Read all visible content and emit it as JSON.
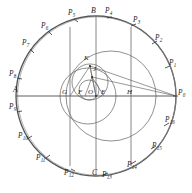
{
  "figure": {
    "name": "heptadecagon-circle-construction",
    "background": "#ffffff",
    "stroke_main": "#555555",
    "stroke_thin": "#6b6b6b",
    "stroke_label": "#1d1d1d",
    "width": 192,
    "height": 193
  },
  "circles": {
    "main": {
      "cx": 96,
      "cy": 96,
      "r": 80,
      "label": "main-circle"
    },
    "inner_large": {
      "cx": 111,
      "cy": 96,
      "r": 45,
      "label": "inner-large-circle"
    },
    "inner_medium": {
      "cx": 88,
      "cy": 96,
      "r": 28,
      "label": "inner-medium-circle"
    },
    "inner_small": {
      "cx": 90,
      "cy": 82,
      "r": 18,
      "label": "inner-small-circle"
    },
    "inner_tiny": {
      "cx": 89,
      "cy": 90,
      "r": 10,
      "label": "inner-tiny-circle"
    }
  },
  "axes": {
    "horizontal_diameter": {
      "x1": 16,
      "y1": 96,
      "x2": 176,
      "y2": 96,
      "label": "diameter-A-P0"
    },
    "vertical_diameter": {
      "x1": 96,
      "y1": 16,
      "x2": 96,
      "y2": 176,
      "label": "diameter-B-C"
    },
    "chord_through_G": {
      "x": 70,
      "y1": 27,
      "y2": 166,
      "label": "vertical-chord-G"
    },
    "chord_through_H": {
      "x": 131,
      "y1": 27,
      "y2": 166,
      "label": "vertical-chord-H"
    }
  },
  "rays": [
    {
      "name": "ray-J-to-P0",
      "x1": 92,
      "y1": 77,
      "x2": 176,
      "y2": 96
    },
    {
      "name": "ray-K-to-P0",
      "x1": 90,
      "y1": 66,
      "x2": 176,
      "y2": 96
    },
    {
      "name": "ray-K-to-O",
      "x1": 90,
      "y1": 66,
      "x2": 96,
      "y2": 96
    },
    {
      "name": "ray-J-to-F",
      "x1": 92,
      "y1": 77,
      "x2": 85,
      "y2": 96
    },
    {
      "name": "ray-J-to-O",
      "x1": 92,
      "y1": 77,
      "x2": 96,
      "y2": 96
    },
    {
      "name": "ray-J-to-E",
      "x1": 92,
      "y1": 77,
      "x2": 104,
      "y2": 96
    },
    {
      "name": "ray-K-to-G",
      "x1": 90,
      "y1": 66,
      "x2": 70,
      "y2": 96
    }
  ],
  "labels": {
    "perimeter_points": [
      {
        "id": "P0",
        "text": "P",
        "sub": "0",
        "x": 178,
        "y": 93,
        "tick": {
          "x1": 174,
          "y1": 96,
          "x2": 178,
          "y2": 96
        }
      },
      {
        "id": "P1",
        "text": "P",
        "sub": "1",
        "x": 169,
        "y": 63,
        "tick": {
          "x1": 166,
          "y1": 68,
          "x2": 170,
          "y2": 66
        }
      },
      {
        "id": "P2",
        "text": "P",
        "sub": "2",
        "x": 155,
        "y": 38,
        "tick": {
          "x1": 153,
          "y1": 44,
          "x2": 157,
          "y2": 41
        }
      },
      {
        "id": "P3",
        "text": "P",
        "sub": "3",
        "x": 133,
        "y": 20,
        "tick": {
          "x1": 132,
          "y1": 26,
          "x2": 136,
          "y2": 24
        }
      },
      {
        "id": "P4",
        "text": "P",
        "sub": "4",
        "x": 105,
        "y": 11,
        "tick": {
          "x1": 107,
          "y1": 18,
          "x2": 111,
          "y2": 17
        }
      },
      {
        "id": "P5",
        "text": "P",
        "sub": "5",
        "x": 69,
        "y": 13,
        "tick": {
          "x1": 74,
          "y1": 19,
          "x2": 78,
          "y2": 21
        }
      },
      {
        "id": "P6",
        "text": "P",
        "sub": "6",
        "x": 42,
        "y": 26,
        "tick": {
          "x1": 48,
          "y1": 31,
          "x2": 52,
          "y2": 34
        }
      },
      {
        "id": "P7",
        "text": "P",
        "sub": "7",
        "x": 23,
        "y": 43,
        "tick": {
          "x1": 30,
          "y1": 49,
          "x2": 34,
          "y2": 52
        }
      },
      {
        "id": "P8",
        "text": "P",
        "sub": "8",
        "x": 11,
        "y": 74,
        "tick": {
          "x1": 18,
          "y1": 78,
          "x2": 22,
          "y2": 79
        }
      },
      {
        "id": "P9",
        "text": "P",
        "sub": "9",
        "x": 11,
        "y": 107,
        "tick": {
          "x1": 18,
          "y1": 112,
          "x2": 22,
          "y2": 111
        }
      },
      {
        "id": "P10",
        "text": "P",
        "sub": "10",
        "x": 20,
        "y": 136,
        "tick": {
          "x1": 28,
          "y1": 138,
          "x2": 32,
          "y2": 136
        }
      },
      {
        "id": "P11",
        "text": "P",
        "sub": "11",
        "x": 38,
        "y": 158,
        "tick": {
          "x1": 46,
          "y1": 157,
          "x2": 50,
          "y2": 154
        }
      },
      {
        "id": "P12",
        "text": "P",
        "sub": "12",
        "x": 66,
        "y": 172,
        "tick": {
          "x1": 71,
          "y1": 168,
          "x2": 75,
          "y2": 170
        }
      },
      {
        "id": "P13",
        "text": "P",
        "sub": "13",
        "x": 104,
        "y": 174,
        "tick": {
          "x1": 104,
          "y1": 174,
          "x2": 108,
          "y2": 173
        }
      },
      {
        "id": "P14",
        "text": "P",
        "sub": "14",
        "x": 129,
        "y": 164,
        "tick": {
          "x1": 132,
          "y1": 163,
          "x2": 136,
          "y2": 161
        }
      },
      {
        "id": "P15",
        "text": "P",
        "sub": "15",
        "x": 154,
        "y": 145,
        "tick": {
          "x1": 152,
          "y1": 148,
          "x2": 156,
          "y2": 145
        }
      },
      {
        "id": "P16",
        "text": "P",
        "sub": "16",
        "x": 167,
        "y": 120,
        "tick": {
          "x1": 165,
          "y1": 125,
          "x2": 169,
          "y2": 122
        }
      }
    ],
    "named_points": [
      {
        "id": "A",
        "text": "A",
        "x": 15,
        "y": 90,
        "size": "cap"
      },
      {
        "id": "B",
        "text": "B",
        "x": 92,
        "y": 11,
        "size": "cap"
      },
      {
        "id": "C",
        "text": "C",
        "x": 93,
        "y": 173,
        "size": "cap"
      },
      {
        "id": "G",
        "text": "G",
        "x": 63,
        "y": 93,
        "size": "cap-sm"
      },
      {
        "id": "F",
        "text": "F",
        "x": 79,
        "y": 93,
        "size": "cap-sm"
      },
      {
        "id": "O",
        "text": "O",
        "x": 90,
        "y": 93,
        "size": "cap-sm"
      },
      {
        "id": "E",
        "text": "E",
        "x": 102,
        "y": 93,
        "size": "cap-sm"
      },
      {
        "id": "H",
        "text": "H",
        "x": 128,
        "y": 93,
        "size": "cap-sm"
      },
      {
        "id": "J",
        "text": "J",
        "x": 93,
        "y": 70,
        "size": "cap-sm"
      },
      {
        "id": "K",
        "text": "K",
        "x": 85,
        "y": 59,
        "size": "cap-sm"
      }
    ]
  }
}
